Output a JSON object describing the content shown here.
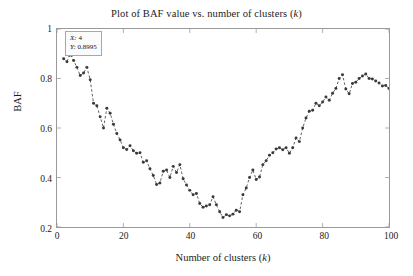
{
  "chart_data": {
    "type": "line",
    "title": "Plot of BAF value vs. number of clusters (k)",
    "title_prefix": "Plot of BAF value vs. number of clusters (",
    "title_italic": "k",
    "title_suffix": ")",
    "xlabel": "Number of clusters (k)",
    "xlabel_prefix": "Number of clusters (",
    "xlabel_italic": "k",
    "xlabel_suffix": ")",
    "ylabel": "BAF",
    "xlim": [
      0,
      100
    ],
    "ylim": [
      0.2,
      1.0
    ],
    "xticks": [
      0,
      20,
      40,
      60,
      80,
      100
    ],
    "xtick_labels": [
      "0",
      "20",
      "40",
      "60",
      "80",
      "100"
    ],
    "yticks": [
      0.2,
      0.4,
      0.6,
      0.8,
      1
    ],
    "ytick_labels": [
      "0.2",
      "0.4",
      "0.6",
      "0.8",
      "1"
    ],
    "grid": false,
    "legend": false,
    "marker": "point",
    "line_style": "dashed",
    "series_color": "#4d4d4d",
    "marker_color": "#3a3a3a",
    "axis_color": "#9a9a9a",
    "x": [
      2,
      3,
      4,
      5,
      6,
      7,
      8,
      9,
      10,
      11,
      12,
      13,
      14,
      15,
      16,
      17,
      18,
      19,
      20,
      21,
      22,
      23,
      24,
      25,
      26,
      27,
      28,
      29,
      30,
      31,
      32,
      33,
      34,
      35,
      36,
      37,
      38,
      39,
      40,
      41,
      42,
      43,
      44,
      45,
      46,
      47,
      48,
      49,
      50,
      51,
      52,
      53,
      54,
      55,
      56,
      57,
      58,
      59,
      60,
      61,
      62,
      63,
      64,
      65,
      66,
      67,
      68,
      69,
      70,
      71,
      72,
      73,
      74,
      75,
      76,
      77,
      78,
      79,
      80,
      81,
      82,
      83,
      84,
      85,
      86,
      87,
      88,
      89,
      90,
      91,
      92,
      93,
      94,
      95,
      96,
      97,
      98,
      99,
      100
    ],
    "y": [
      0.88,
      0.868,
      0.8995,
      0.873,
      0.845,
      0.812,
      0.822,
      0.845,
      0.795,
      0.7,
      0.69,
      0.645,
      0.6,
      0.68,
      0.66,
      0.615,
      0.578,
      0.552,
      0.52,
      0.513,
      0.528,
      0.508,
      0.498,
      0.5,
      0.462,
      0.468,
      0.435,
      0.408,
      0.372,
      0.378,
      0.425,
      0.43,
      0.4,
      0.445,
      0.42,
      0.452,
      0.395,
      0.37,
      0.348,
      0.33,
      0.335,
      0.295,
      0.28,
      0.285,
      0.29,
      0.322,
      0.29,
      0.262,
      0.238,
      0.25,
      0.245,
      0.252,
      0.268,
      0.262,
      0.33,
      0.358,
      0.4,
      0.43,
      0.392,
      0.402,
      0.452,
      0.468,
      0.49,
      0.5,
      0.515,
      0.52,
      0.512,
      0.52,
      0.498,
      0.52,
      0.56,
      0.545,
      0.6,
      0.64,
      0.668,
      0.672,
      0.7,
      0.69,
      0.705,
      0.725,
      0.712,
      0.74,
      0.76,
      0.8,
      0.815,
      0.758,
      0.738,
      0.78,
      0.785,
      0.8,
      0.81,
      0.818,
      0.8,
      0.798,
      0.79,
      0.782,
      0.77,
      0.772,
      0.76
    ],
    "datatip": {
      "x_label": "X",
      "x_value": "4",
      "y_label": "Y",
      "y_value": "0.8995",
      "x_line": "X: 4",
      "y_line": "Y: 0.8995",
      "point_x": 4,
      "point_y": 0.8995
    }
  }
}
